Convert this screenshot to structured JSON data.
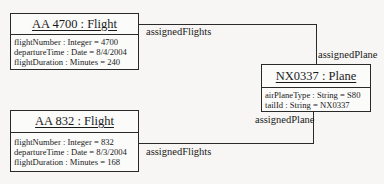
{
  "diagram": {
    "type": "UML object diagram",
    "objects": [
      {
        "id": "flight1",
        "title": "AA 4700 : Flight",
        "attributes": [
          "flightNumber : Integer = 4700",
          "departureTime : Date = 8/4/2004",
          "flightDuration : Minutes = 240"
        ]
      },
      {
        "id": "flight2",
        "title": "AA 832 : Flight",
        "attributes": [
          "flightNumber : Integer = 832",
          "departureTime : Date = 8/3/2004",
          "flightDuration : Minutes = 168"
        ]
      },
      {
        "id": "plane",
        "title": "NX0337 : Plane",
        "attributes": [
          "airPlaneType : String = S80",
          "tailId : String = NX0337"
        ]
      }
    ],
    "links": [
      {
        "from": "flight1",
        "to": "plane",
        "from_role": "assignedFlights",
        "to_role": "assignedPlane"
      },
      {
        "from": "flight2",
        "to": "plane",
        "from_role": "assignedFlights",
        "to_role": "assignedPlane"
      }
    ]
  }
}
